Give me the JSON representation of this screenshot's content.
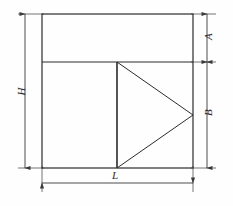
{
  "figure": {
    "type": "technical-drawing",
    "background_color": "#fefefe",
    "line_color": "#2b2b2b",
    "dimension_line_color": "#3a3a3a"
  },
  "dimensions": {
    "height_overall": {
      "label": "H",
      "orientation": "vertical",
      "side": "left"
    },
    "length_overall": {
      "label": "L",
      "orientation": "horizontal",
      "side": "bottom"
    },
    "upper_band": {
      "label": "A",
      "orientation": "vertical",
      "side": "right"
    },
    "lower_band": {
      "label": "B",
      "orientation": "vertical",
      "side": "right"
    }
  },
  "geometry": {
    "outer_rect": {
      "x": 42,
      "y": 14,
      "width": 151,
      "height": 154
    },
    "divider_y": 62,
    "triangle": {
      "base_x": 117,
      "top_y": 62,
      "bottom_y": 168,
      "apex_x": 193,
      "apex_y": 115
    }
  }
}
